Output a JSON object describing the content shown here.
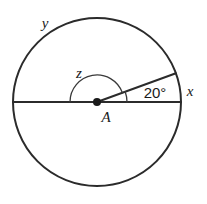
{
  "figure": {
    "type": "circle-central-angle-diagram",
    "background_color": "#ffffff",
    "stroke_color": "#2b2b2b",
    "arc_color": "#3a3a3a"
  },
  "circle": {
    "center_label": "A",
    "center_x": 97,
    "center_y": 102,
    "radius": 84
  },
  "labels": {
    "major_arc": "y",
    "reflex_angle": "z",
    "minor_arc": "x",
    "angle_measure": "20°",
    "center_point": "A"
  },
  "angles": {
    "marked_degrees": 20,
    "reflex_degrees": 340,
    "semicircle_degrees": 180
  },
  "elements": {
    "diameter_name": "horizontal-diameter",
    "ray_name": "radius-ray-20deg",
    "small_arc_name": "angle-arc-20deg",
    "large_arc_name": "angle-arc-z"
  }
}
